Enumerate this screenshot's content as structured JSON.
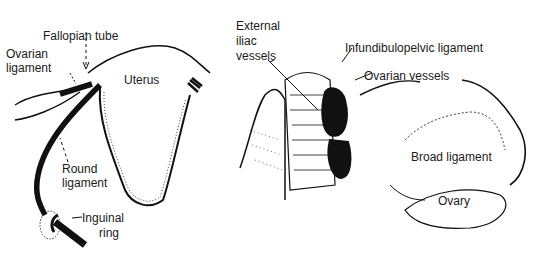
{
  "left_panel": {
    "labels": {
      "fallopian_tube": "Fallopian tube",
      "ovarian_ligament_1": "Ovarian",
      "ovarian_ligament_2": "ligament",
      "uterus": "Uterus",
      "round_ligament_1": "Round",
      "round_ligament_2": "ligament",
      "inguinal_ring_1": "Inguinal",
      "inguinal_ring_2": "ring"
    }
  },
  "right_panel": {
    "labels": {
      "external_iliac_1": "External",
      "external_iliac_2": "iliac",
      "external_iliac_3": "vessels",
      "infundibulopelvic": "Infundibulopelvic ligament",
      "ovarian_vessels": "Ovarian vessels",
      "broad_ligament": "Broad ligament",
      "ovary": "Ovary"
    }
  }
}
